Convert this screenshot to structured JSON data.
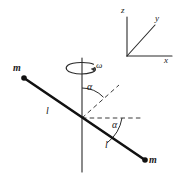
{
  "figure": {
    "background_color": "#ffffff",
    "line_color": "#1a1a1a",
    "rod_color": "#111111",
    "dash_color": "#3a3a3a"
  },
  "axes_triad": {
    "z_label": "z",
    "y_label": "y",
    "x_label": "x",
    "origin": {
      "x": 127,
      "y": 56
    },
    "z_tip": {
      "x": 127,
      "y": 16
    },
    "x_tip": {
      "x": 172,
      "y": 56
    },
    "y_tip": {
      "x": 156,
      "y": 25
    }
  },
  "rotation": {
    "omega_label": "ω",
    "arrow_center": {
      "x": 81,
      "y": 68
    },
    "arrow_rx": 14,
    "arrow_ry": 5
  },
  "rotation_axis": {
    "label": "rotation-axis",
    "top": {
      "x": 82,
      "y": 58
    },
    "bottom": {
      "x": 82,
      "y": 172
    }
  },
  "rod": {
    "center": {
      "x": 82,
      "y": 118
    },
    "end_upper_left": {
      "x": 24,
      "y": 78
    },
    "end_lower_right": {
      "x": 145,
      "y": 160
    },
    "length_label_upper": "l",
    "length_label_lower": "l",
    "mass_label_upper": "m",
    "mass_label_lower": "m"
  },
  "dashed_lines": {
    "upper_extension": {
      "x1": 82,
      "y1": 118,
      "x2": 119,
      "y2": 85
    },
    "horizontal": {
      "x1": 82,
      "y1": 118,
      "x2": 142,
      "y2": 118
    }
  },
  "angles": {
    "upper": {
      "label": "α",
      "x": 89,
      "y": 92
    },
    "lower": {
      "label": "α",
      "x": 114,
      "y": 124
    }
  },
  "labels": {
    "z": {
      "text": "z",
      "x": 123,
      "y": 9
    },
    "y": {
      "text": "y",
      "x": 157,
      "y": 18
    },
    "x": {
      "text": "x",
      "x": 165,
      "y": 59
    },
    "omega": {
      "text": "ω",
      "x": 96,
      "y": 62
    },
    "mass_upper": {
      "text": "m",
      "x": 14,
      "y": 66
    },
    "mass_lower": {
      "text": "m",
      "x": 150,
      "y": 158
    },
    "len_upper": {
      "text": "l",
      "x": 47,
      "y": 108
    },
    "len_lower": {
      "text": "l",
      "x": 106,
      "y": 142
    },
    "alpha_upper": {
      "text": "α",
      "x": 88,
      "y": 86
    },
    "alpha_lower": {
      "text": "α",
      "x": 113,
      "y": 124
    }
  }
}
